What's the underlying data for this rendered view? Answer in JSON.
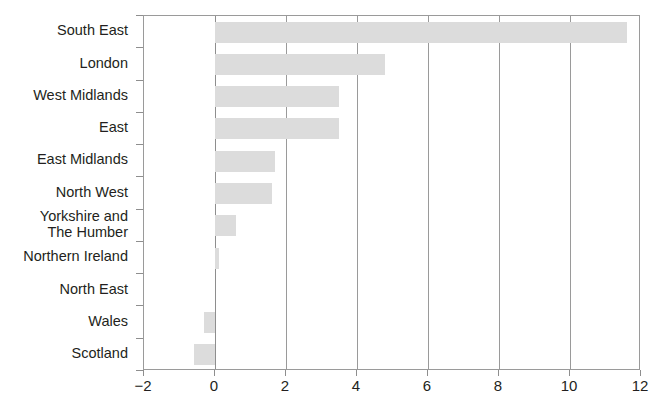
{
  "chart_data": {
    "type": "bar",
    "orientation": "horizontal",
    "title": "",
    "subtitle": "",
    "xlabel": "",
    "ylabel": "",
    "categories": [
      "South East",
      "London",
      "West Midlands",
      "East",
      "East Midlands",
      "North West",
      "Yorkshire and\nThe Humber",
      "Northern Ireland",
      "North East",
      "Wales",
      "Scotland"
    ],
    "values": [
      11.6,
      4.8,
      3.5,
      3.5,
      1.7,
      1.6,
      0.6,
      0.1,
      0.0,
      -0.3,
      -0.6
    ],
    "xlim": [
      -2,
      12
    ],
    "xticks": [
      -2,
      0,
      2,
      4,
      6,
      8,
      10,
      12
    ],
    "xtick_labels": [
      "−2",
      "0",
      "2",
      "4",
      "6",
      "8",
      "10",
      "12"
    ],
    "grid": true,
    "grid_axis": "x",
    "legend": false,
    "legend_position": "none",
    "bar_color": "#dcdcdc",
    "axis_color": "#9a9a9a",
    "text_color": "#231f20"
  }
}
